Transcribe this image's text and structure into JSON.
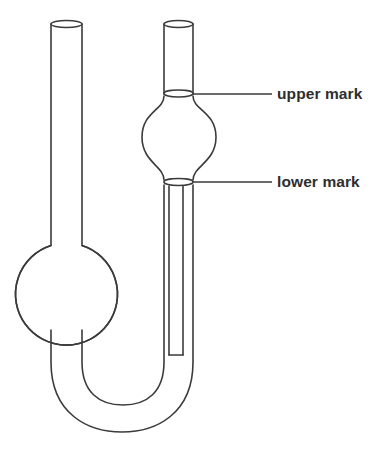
{
  "diagram": {
    "type": "line-diagram",
    "background_color": "#ffffff",
    "stroke_color": "#3b3b3b",
    "label_color": "#2e2e2e",
    "callouts": [
      {
        "id": "upper-mark",
        "label": "upper mark",
        "leader_from_x": 193,
        "leader_to_x": 272,
        "leader_y": 94
      },
      {
        "id": "lower-mark",
        "label": "lower mark",
        "leader_from_x": 193,
        "leader_to_x": 272,
        "leader_y": 182
      }
    ],
    "parts": {
      "left_tube": {
        "name": "left open tube",
        "left_x": 51,
        "right_x": 82,
        "top_y": 24
      },
      "left_bulb": {
        "name": "reservoir bulb",
        "center_x": 66,
        "center_y": 288,
        "radius": 51
      },
      "right_tube": {
        "name": "right open tube",
        "left_x": 164,
        "right_x": 193,
        "top_y": 24
      },
      "upper_bulb": {
        "name": "measuring bulb",
        "center_x": 179,
        "center_y": 137,
        "radius": 37
      },
      "capillary": {
        "name": "capillary",
        "left_x": 169,
        "right_x": 183,
        "top_y": 185,
        "bottom_y": 355
      },
      "u_bend": {
        "name": "u-bend",
        "outer_bottom_y": 432,
        "inner_bottom_y": 405
      }
    }
  }
}
